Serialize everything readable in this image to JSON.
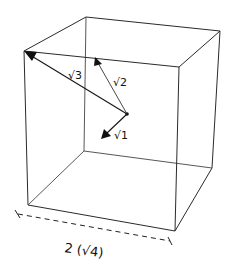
{
  "diagram": {
    "type": "cube-diagonals",
    "vectors": [
      {
        "label": "√1",
        "target": "face-center"
      },
      {
        "label": "√2",
        "target": "edge-midpoint"
      },
      {
        "label": "√3",
        "target": "corner"
      }
    ],
    "dimension": {
      "label": "2 (√4)"
    }
  }
}
